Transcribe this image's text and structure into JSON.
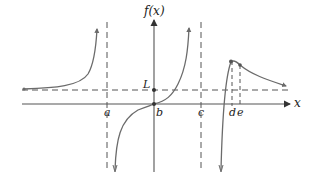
{
  "figure": {
    "y_axis_label": "f(x)",
    "x_axis_label": "x",
    "labels": {
      "L": "L",
      "a": "a",
      "b": "b",
      "c": "c",
      "d": "d",
      "e": "e"
    },
    "colors": {
      "curve": "#6b6b6b",
      "axis": "#555555",
      "dashed": "#555555",
      "text": "#222222"
    }
  }
}
